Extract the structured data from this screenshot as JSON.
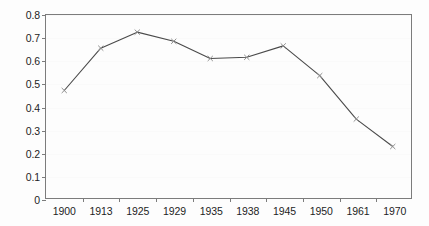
{
  "chart_data": {
    "type": "line",
    "title": "",
    "subtitle": "",
    "xlabel": "",
    "ylabel": "",
    "categories": [
      "1900",
      "1913",
      "1925",
      "1929",
      "1935",
      "1938",
      "1945",
      "1950",
      "1961",
      "1970"
    ],
    "values": [
      0.47,
      0.655,
      0.725,
      0.685,
      0.61,
      0.615,
      0.665,
      0.535,
      0.345,
      0.225
    ],
    "series": [
      {
        "name": "",
        "values": [
          0.47,
          0.655,
          0.725,
          0.685,
          0.61,
          0.615,
          0.665,
          0.535,
          0.345,
          0.225
        ]
      }
    ],
    "ylim": [
      0,
      0.8
    ],
    "y_ticks": [
      "0",
      "0.1",
      "0.2",
      "0.3",
      "0.4",
      "0.5",
      "0.6",
      "0.7",
      "0.8"
    ],
    "y_tick_values": [
      0,
      0.1,
      0.2,
      0.3,
      0.4,
      0.5,
      0.6,
      0.7,
      0.8
    ],
    "x_ticks": [
      "1900",
      "1913",
      "1925",
      "1929",
      "1935",
      "1938",
      "1945",
      "1950",
      "1961",
      "1970"
    ],
    "grid": true,
    "grid_axis": "y",
    "legend": false,
    "legend_position": "none",
    "annotations": [],
    "marker": "cross",
    "line_color": "#4a4a4a",
    "marker_color": "#8d8d8d",
    "frame_color": "#7c7c7c",
    "background_color": "#fdfdfd",
    "text_color": "#1d1d1d"
  }
}
